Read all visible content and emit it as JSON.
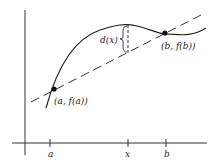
{
  "diagram": {
    "type": "mean-value-theorem-illustration",
    "labels": {
      "point_a": "(a, f(a))",
      "point_b": "(b, f(b))",
      "distance": "d(x)",
      "tick_a": "a",
      "tick_x": "x",
      "tick_b": "b"
    },
    "colors": {
      "stroke": "#222222",
      "background": "#ffffff"
    }
  }
}
